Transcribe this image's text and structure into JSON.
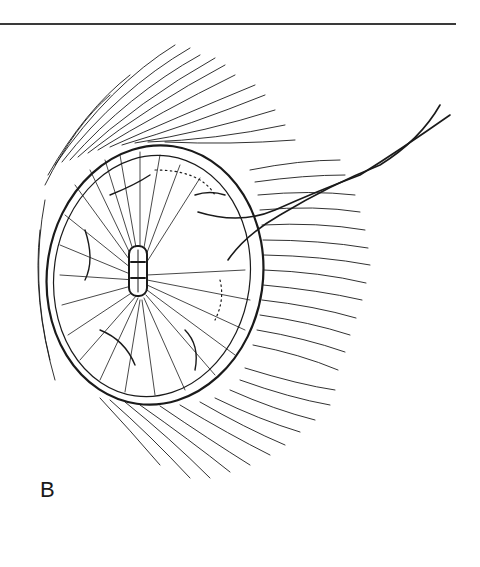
{
  "figure": {
    "panel_label": "B",
    "colors": {
      "ink": "#1a1a1a",
      "background": "#ffffff",
      "rule": "#3a3a3a"
    }
  }
}
